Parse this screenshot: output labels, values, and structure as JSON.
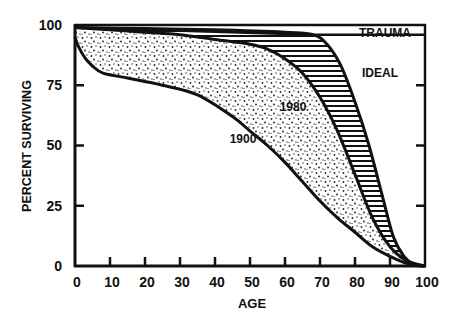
{
  "chart_data": {
    "type": "area",
    "title": "",
    "xlabel": "AGE",
    "ylabel": "PERCENT SURVIVING",
    "xlim": [
      0,
      100
    ],
    "ylim": [
      0,
      100
    ],
    "x_ticks": [
      "0",
      "10",
      "20",
      "30",
      "40",
      "50",
      "60",
      "70",
      "80",
      "90",
      "100"
    ],
    "y_ticks": [
      "0",
      "25",
      "50",
      "75",
      "100"
    ],
    "grid": false,
    "legend": "inline labels",
    "series": [
      {
        "name": "1900",
        "x": [
          0,
          1,
          3,
          5,
          8,
          15,
          25,
          35,
          45,
          50,
          55,
          60,
          65,
          70,
          75,
          80,
          85,
          90,
          95,
          100
        ],
        "values": [
          95,
          91,
          86,
          83,
          80,
          78,
          75,
          71,
          62,
          56,
          50,
          43,
          35,
          27,
          20,
          14,
          8,
          4,
          1,
          0
        ]
      },
      {
        "name": "1980",
        "x": [
          0,
          10,
          20,
          30,
          40,
          50,
          55,
          60,
          65,
          70,
          75,
          80,
          85,
          90,
          95,
          100
        ],
        "values": [
          99,
          98,
          97,
          96,
          94,
          92,
          90,
          86,
          80,
          70,
          56,
          38,
          20,
          8,
          2,
          0
        ]
      },
      {
        "name": "IDEAL",
        "x": [
          0,
          20,
          40,
          60,
          68,
          72,
          76,
          80,
          84,
          88,
          91,
          94,
          97,
          100
        ],
        "values": [
          99,
          98.5,
          98,
          97,
          96,
          92,
          83,
          68,
          50,
          28,
          12,
          4,
          0.5,
          0
        ]
      },
      {
        "name": "TRAUMA",
        "x": [
          0,
          68,
          100
        ],
        "values": [
          99,
          96,
          96
        ]
      }
    ],
    "annotations": [
      {
        "text": "TRAUMA",
        "x": 90,
        "y": 98
      },
      {
        "text": "IDEAL",
        "x": 87,
        "y": 85
      },
      {
        "text": "1980",
        "x": 65,
        "y": 78
      },
      {
        "text": "1900",
        "x": 48,
        "y": 53
      }
    ],
    "fills": [
      {
        "between": [
          "1900",
          "1980"
        ],
        "pattern": "stipple"
      },
      {
        "between": [
          "1980",
          "IDEAL"
        ],
        "pattern": "horizontal-hatch"
      }
    ]
  },
  "labels": {
    "x_axis": "AGE",
    "y_axis": "PERCENT SURVIVING",
    "trauma": "TRAUMA",
    "ideal": "IDEAL",
    "y1980": "1980",
    "y1900": "1900"
  },
  "ticks": {
    "x": [
      "0",
      "10",
      "20",
      "30",
      "40",
      "50",
      "60",
      "70",
      "80",
      "90",
      "100"
    ],
    "y": [
      "0",
      "25",
      "50",
      "75",
      "100"
    ]
  }
}
